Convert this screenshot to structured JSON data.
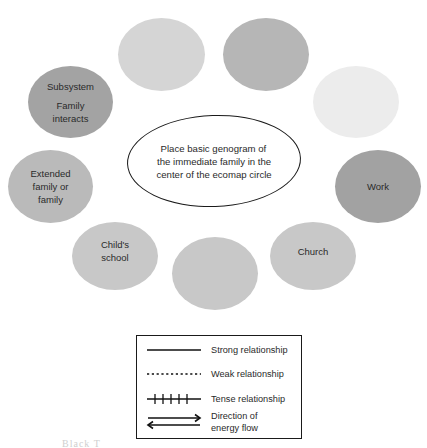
{
  "diagram": {
    "type": "ecomap",
    "center": {
      "lines": [
        "Place basic genogram of",
        "the immediate family in the",
        "center of the ecomap circle"
      ]
    },
    "systems": [
      {
        "id": "top-left",
        "lines": [],
        "color": "#d5d5d5"
      },
      {
        "id": "top-right",
        "lines": [],
        "color": "#b6b6b6"
      },
      {
        "id": "right-upper",
        "lines": [],
        "color": "#ececec"
      },
      {
        "id": "subsystem",
        "title": "Subsystem",
        "lines": [
          "Family",
          "interacts"
        ],
        "color": "#a3a3a3"
      },
      {
        "id": "extended-family",
        "lines": [
          "Extended",
          "family or",
          "family"
        ],
        "color": "#bababa"
      },
      {
        "id": "work",
        "lines": [
          "Work"
        ],
        "color": "#a2a2a2"
      },
      {
        "id": "childs-school",
        "lines": [
          "Child's",
          "school"
        ],
        "color": "#c8c8c8"
      },
      {
        "id": "bottom-center",
        "lines": [],
        "color": "#c8c8c8"
      },
      {
        "id": "church",
        "lines": [
          "Church"
        ],
        "color": "#c8c8c8"
      }
    ]
  },
  "legend": {
    "items": [
      {
        "symbol": "solid-line",
        "label": "Strong relationship"
      },
      {
        "symbol": "dotted-line",
        "label": "Weak relationship"
      },
      {
        "symbol": "hatched-line",
        "label": "Tense relationship"
      },
      {
        "symbol": "double-arrow",
        "label_lines": [
          "Direction of",
          "energy flow"
        ]
      }
    ]
  },
  "caption": {
    "text": "Black T"
  }
}
